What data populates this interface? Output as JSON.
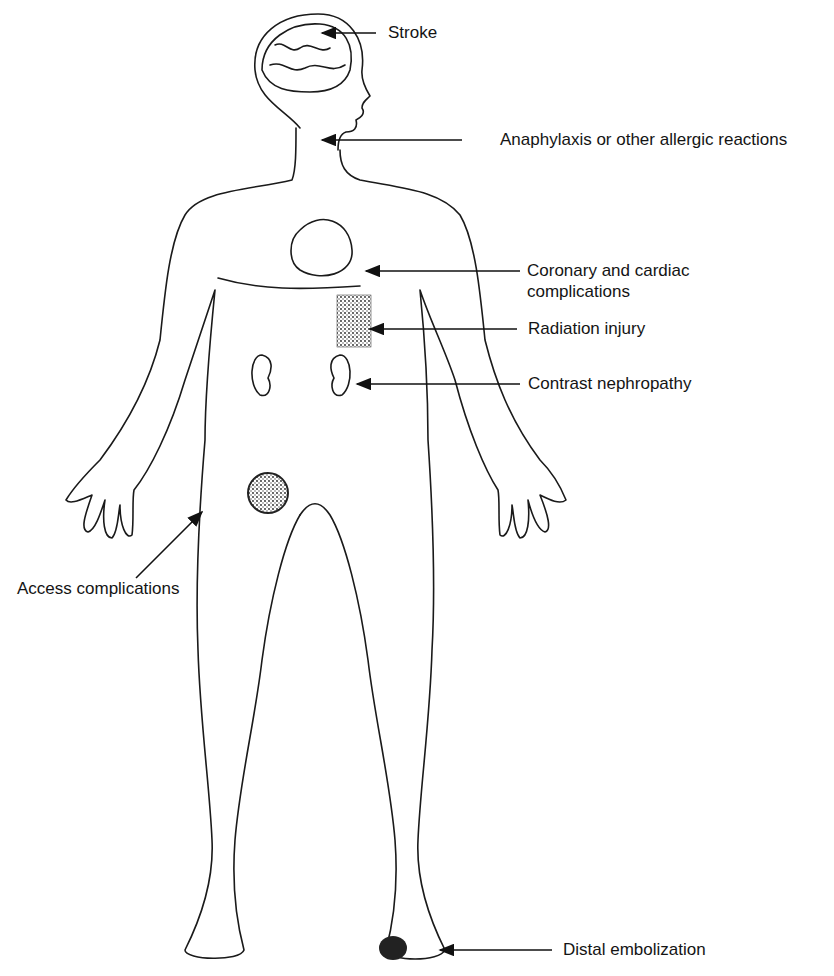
{
  "figure": {
    "stroke_color": "#1a1a1a",
    "background": "#ffffff"
  },
  "labels": {
    "stroke": "Stroke",
    "anaphylaxis": "Anaphylaxis or other allergic reactions",
    "coronary": "Coronary and cardiac complications",
    "radiation": "Radiation injury",
    "contrast": "Contrast nephropathy",
    "access": "Access complications",
    "distal": "Distal embolization"
  }
}
